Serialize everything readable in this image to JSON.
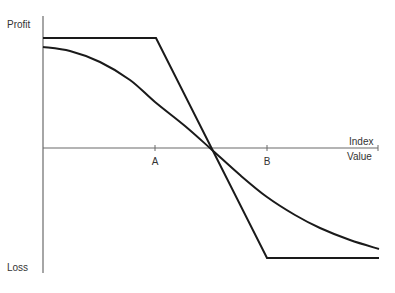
{
  "chart_data": {
    "type": "line",
    "title": "",
    "xlabel": "Index Value",
    "ylabel_top": "Profit",
    "ylabel_bottom": "Loss",
    "x_ticks": [
      {
        "label": "A",
        "px": 155
      },
      {
        "label": "B",
        "px": 267
      }
    ],
    "axes": {
      "origin_x": 43,
      "y_axis_top": 16,
      "y_axis_bottom": 273,
      "x_axis_y": 148,
      "x_axis_end": 378
    },
    "grid": false,
    "legend": null,
    "series": [
      {
        "name": "piecewise-linear payoff",
        "points": [
          [
            43,
            38
          ],
          [
            156,
            38
          ],
          [
            267,
            258
          ],
          [
            379,
            258
          ]
        ]
      },
      {
        "name": "smooth curve payoff",
        "points": [
          [
            43,
            47
          ],
          [
            70,
            51
          ],
          [
            100,
            62
          ],
          [
            130,
            80
          ],
          [
            155,
            102
          ],
          [
            185,
            126
          ],
          [
            211,
            149
          ],
          [
            240,
            175
          ],
          [
            267,
            197
          ],
          [
            295,
            215
          ],
          [
            320,
            228
          ],
          [
            350,
            240
          ],
          [
            379,
            249
          ]
        ]
      }
    ],
    "colors": {
      "axis": "#6b6b6b",
      "line": "#1a1a1a",
      "text": "#333333"
    }
  }
}
